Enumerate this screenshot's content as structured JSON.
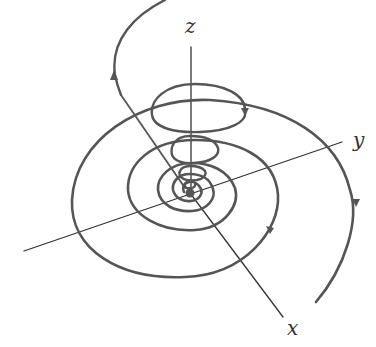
{
  "diagram": {
    "axes": {
      "x_label": "x",
      "y_label": "y",
      "z_label": "z"
    },
    "colors": {
      "curve": "#555555",
      "axis": "#333333",
      "background": "#ffffff"
    },
    "elements": [
      "Planar spiral in xy-plane converging to origin",
      "Conical helix spiral descending along z-axis to origin",
      "Direction arrows on trajectories"
    ]
  }
}
